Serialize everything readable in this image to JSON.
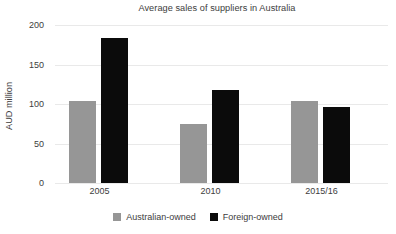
{
  "chart_data": {
    "type": "bar",
    "title": "Average sales of suppliers in Australia",
    "xlabel": "",
    "ylabel": "AUD million",
    "categories": [
      "2005",
      "2010",
      "2015/16"
    ],
    "series": [
      {
        "name": "Australian-owned",
        "color": "#969696",
        "values": [
          104,
          75,
          104
        ]
      },
      {
        "name": "Foreign-owned",
        "color": "#0b0b0b",
        "values": [
          183,
          118,
          96
        ]
      }
    ],
    "ylim": [
      0,
      200
    ],
    "yticks": [
      0,
      50,
      100,
      150,
      200
    ],
    "ytick_labels": [
      "0",
      "50",
      "100",
      "150",
      "200"
    ],
    "grid": true,
    "legend_position": "bottom"
  }
}
